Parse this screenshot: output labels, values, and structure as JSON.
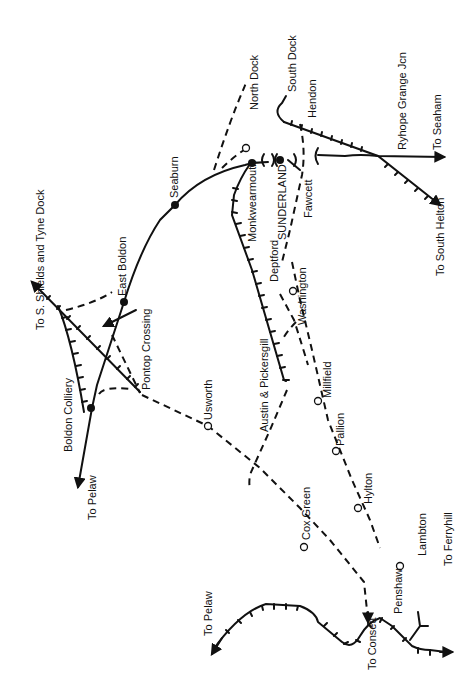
{
  "map": {
    "title": "Sunderland area railways",
    "orientation": "rotated 90° (text reads bottom-to-top)",
    "colors": {
      "ink": "#111111",
      "background": "#ffffff"
    },
    "legend_styles": {
      "solid": "passenger line (open)",
      "dashed": "closed / former line",
      "ticked": "mineral / goods line",
      "filled_dot": "open station",
      "open_circle": "closed station"
    },
    "destinations": [
      {
        "id": "to-s-shields",
        "label": "To S. Shields and Tyne Dock"
      },
      {
        "id": "to-pelaw-north",
        "label": "To Pelaw"
      },
      {
        "id": "to-pelaw-south",
        "label": "To Pelaw"
      },
      {
        "id": "to-consett",
        "label": "To Consett"
      },
      {
        "id": "to-ferryhill",
        "label": "To Ferryhill"
      },
      {
        "id": "to-seaham",
        "label": "To Seaham"
      },
      {
        "id": "to-south-helton",
        "label": "To South Helton"
      }
    ],
    "stations": [
      {
        "id": "seaburn",
        "label": "Seaburn",
        "type": "open"
      },
      {
        "id": "east-boldon",
        "label": "East Boldon",
        "type": "open"
      },
      {
        "id": "boldon-colliery",
        "label": "Boldon Colliery",
        "type": "open"
      },
      {
        "id": "monkwearmouth",
        "label": "Monkwearmouth",
        "type": "open"
      },
      {
        "id": "sunderland",
        "label": "SUNDERLAND",
        "type": "open"
      },
      {
        "id": "usworth",
        "label": "Usworth",
        "type": "closed"
      },
      {
        "id": "washington",
        "label": "Washington",
        "type": "closed"
      },
      {
        "id": "millfield",
        "label": "Millfield",
        "type": "closed"
      },
      {
        "id": "pallion",
        "label": "Pallion",
        "type": "closed"
      },
      {
        "id": "hylton",
        "label": "Hylton",
        "type": "closed"
      },
      {
        "id": "cox-green",
        "label": "Cox Green",
        "type": "closed"
      },
      {
        "id": "penshaw",
        "label": "Penshaw",
        "type": "closed"
      }
    ],
    "places": [
      {
        "id": "north-dock",
        "label": "North Dock"
      },
      {
        "id": "south-dock",
        "label": "South Dock"
      },
      {
        "id": "hendon",
        "label": "Hendon"
      },
      {
        "id": "ryhope-grange",
        "label": "Ryhope Grange Jcn"
      },
      {
        "id": "fawcett",
        "label": "Fawcett"
      },
      {
        "id": "deptford",
        "label": "Deptford"
      },
      {
        "id": "austin-pickersgill",
        "label": "Austin & Pickersgill"
      },
      {
        "id": "pontop-crossing",
        "label": "Pontop Crossing"
      },
      {
        "id": "lambton",
        "label": "Lambton"
      }
    ]
  }
}
